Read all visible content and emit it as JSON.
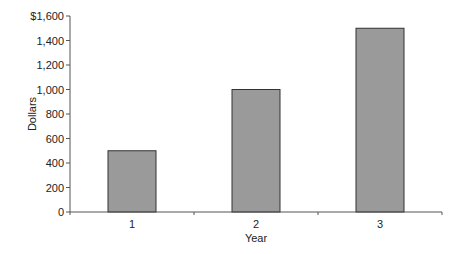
{
  "chart_data": {
    "type": "bar",
    "title": "",
    "xlabel": "Year",
    "ylabel": "Dollars",
    "categories": [
      "1",
      "2",
      "3"
    ],
    "values": [
      500,
      1000,
      1500
    ],
    "ylim": [
      0,
      1600
    ],
    "yticks": [
      0,
      200,
      400,
      600,
      800,
      1000,
      1200,
      1400,
      1600
    ],
    "ytick_labels": [
      "0",
      "200",
      "400",
      "600",
      "800",
      "1,000",
      "1,200",
      "1,400",
      "$1,600"
    ],
    "grid": false,
    "legend": null,
    "bar_color": "#9a9a9a",
    "bar_edge_color": "#333333"
  }
}
